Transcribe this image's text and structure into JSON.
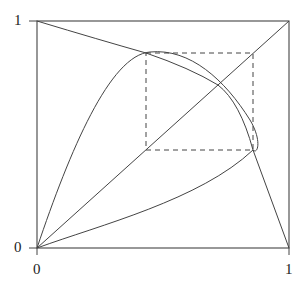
{
  "axes": {
    "y_top_label": "1",
    "y_bottom_label": "0",
    "x_left_label": "0",
    "x_right_label": "1"
  },
  "diagram": {
    "type": "cobweb-2-cycle",
    "two_cycle_points": [
      0.43,
      0.857
    ],
    "fixed_point": 0.72,
    "stroke_color": "#333333",
    "dashed_color": "#444444"
  }
}
